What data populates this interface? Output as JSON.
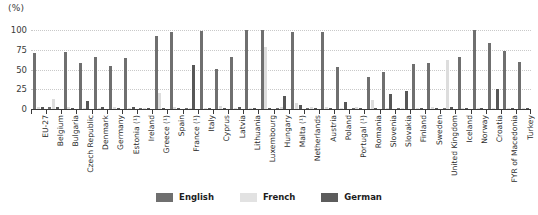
{
  "chart_data": {
    "type": "bar",
    "title": "",
    "subtitle": "",
    "xlabel": "",
    "ylabel": "(%)",
    "unit_label": "(%)",
    "ylim": [
      0,
      100
    ],
    "yticks": [
      0,
      25,
      50,
      75,
      100
    ],
    "ytick_labels": [
      "0",
      "25",
      "50",
      "75",
      "100"
    ],
    "grid": true,
    "grid_axis": "y",
    "legend_position": "bottom",
    "categories": [
      "EU-27",
      "Belgium",
      "Bulgaria",
      "Czech Republic",
      "Denmark",
      "Germany",
      "Estonia (¹)",
      "Ireland",
      "Greece (¹)",
      "Spain",
      "France (¹)",
      "Italy",
      "Cyprus",
      "Latvia",
      "Lithuania",
      "Luxembourg",
      "Hungary",
      "Malta (¹)",
      "Netherlands",
      "Austria",
      "Poland",
      "Portugal (¹)",
      "Romania",
      "Slovenia",
      "Slovakia",
      "Finland",
      "Sweden",
      "United Kingdom",
      "Iceland",
      "Norway",
      "Croatia",
      "FYR of Macedonia",
      "Turkey"
    ],
    "series": [
      {
        "name": "English",
        "color": "#6f6f6f",
        "values": [
          71,
          3,
          72,
          58,
          66,
          55,
          65,
          0,
          93,
          98,
          0,
          99,
          51,
          66,
          100,
          100,
          0,
          98,
          0,
          98,
          53,
          0,
          40,
          47,
          0,
          57,
          58,
          0,
          66,
          100,
          83,
          74,
          59
        ]
      },
      {
        "name": "French",
        "color": "#dddddd",
        "values": [
          2,
          13,
          3,
          1,
          1,
          2,
          1,
          0,
          20,
          2,
          0,
          1,
          4,
          0,
          0,
          79,
          2,
          7,
          2,
          2,
          0,
          3,
          12,
          1,
          0,
          1,
          2,
          62,
          0,
          1,
          1,
          0,
          1
        ]
      },
      {
        "name": "German",
        "color": "#575757",
        "values": [
          2,
          2,
          1,
          10,
          2,
          1,
          3,
          0,
          1,
          1,
          56,
          1,
          1,
          2,
          1,
          1,
          17,
          5,
          0,
          1,
          9,
          1,
          1,
          19,
          23,
          1,
          1,
          3,
          1,
          1,
          25,
          1,
          1
        ]
      }
    ],
    "legend": [
      {
        "label": "English",
        "color": "#6f6f6f"
      },
      {
        "label": "French",
        "color": "#e2e2e2"
      },
      {
        "label": "German",
        "color": "#5c5c5c"
      }
    ]
  }
}
